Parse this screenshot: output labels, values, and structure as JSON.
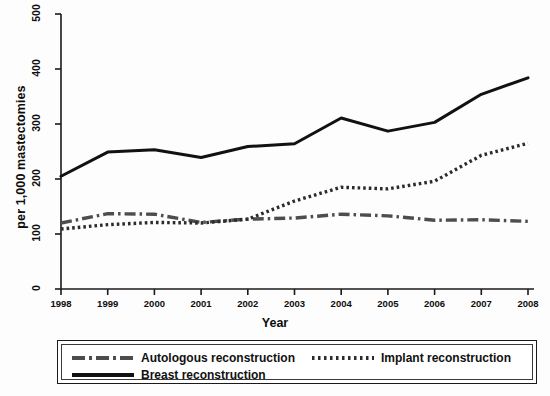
{
  "chart_data": {
    "type": "line",
    "title": "",
    "xlabel": "Year",
    "ylabel": "per 1,000 mastectomies",
    "x": [
      1998,
      1999,
      2000,
      2001,
      2002,
      2003,
      2004,
      2005,
      2006,
      2007,
      2008
    ],
    "xtick_labels": [
      "1998",
      "1999",
      "2000",
      "2001",
      "2002",
      "2003",
      "2004",
      "2005",
      "2006",
      "2007",
      "2008"
    ],
    "ytick_labels": [
      "0",
      "100",
      "200",
      "300",
      "400",
      "500"
    ],
    "yticks": [
      0,
      100,
      200,
      300,
      400,
      500
    ],
    "ylim": [
      0,
      500
    ],
    "xlim": [
      1998,
      2008
    ],
    "grid": false,
    "legend_position": "below-plot",
    "series": [
      {
        "name": "Autologous reconstruction",
        "style": "dash-dot",
        "color": "#4d4d4d",
        "values": [
          120,
          137,
          136,
          121,
          127,
          129,
          136,
          133,
          125,
          126,
          123
        ]
      },
      {
        "name": "Implant reconstruction",
        "style": "dotted",
        "color": "#2b2b2b",
        "values": [
          109,
          117,
          121,
          120,
          127,
          160,
          185,
          182,
          196,
          243,
          265
        ]
      },
      {
        "name": "Breast reconstruction",
        "style": "solid",
        "color": "#111111",
        "values": [
          205,
          249,
          253,
          239,
          259,
          264,
          311,
          287,
          303,
          354,
          384
        ]
      }
    ]
  },
  "legend": {
    "items": [
      {
        "label": "Autologous reconstruction"
      },
      {
        "label": "Implant reconstruction"
      },
      {
        "label": "Breast reconstruction"
      }
    ]
  }
}
